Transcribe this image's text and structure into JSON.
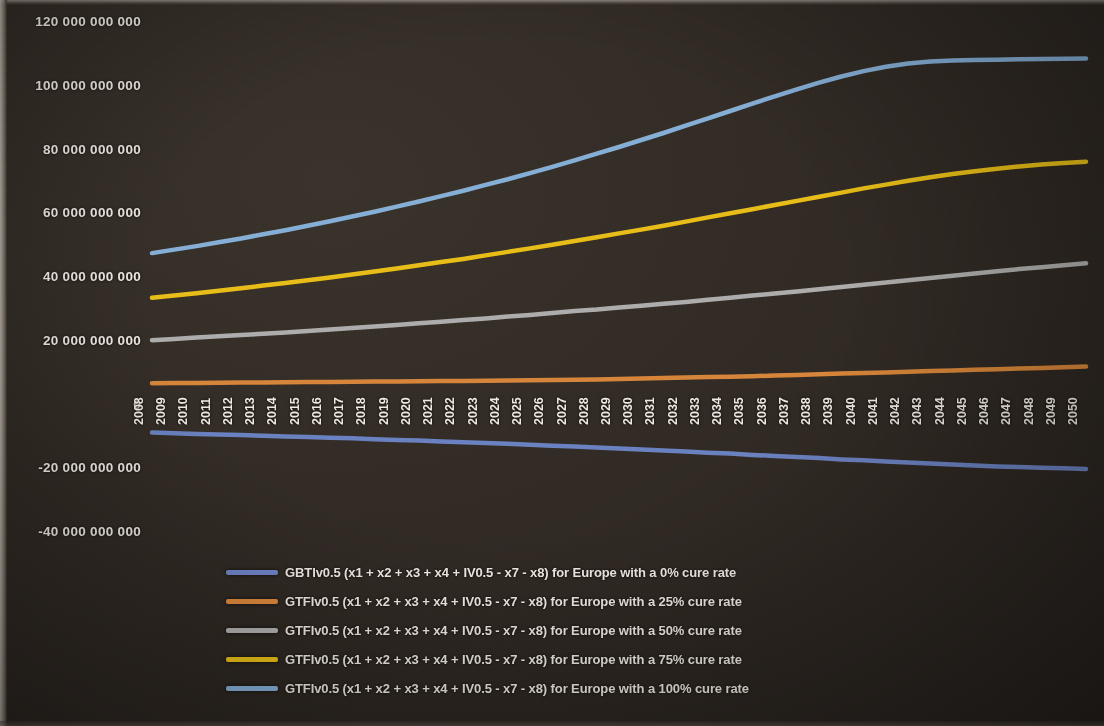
{
  "chart_data": {
    "type": "line",
    "title": "",
    "xlabel": "",
    "ylabel": "",
    "grid": false,
    "legend_position": "bottom",
    "ylim": [
      -40000000000,
      120000000000
    ],
    "ytick_labels": [
      "120 000 000 000",
      "100 000 000 000",
      "80 000 000 000",
      "60 000 000 000",
      "40 000 000 000",
      "20 000 000 000",
      "0",
      "-20 000 000 000",
      "-40 000 000 000"
    ],
    "ytick_values": [
      120000000000,
      100000000000,
      80000000000,
      60000000000,
      40000000000,
      20000000000,
      0,
      -20000000000,
      -40000000000
    ],
    "categories": [
      "2008",
      "2009",
      "2010",
      "2011",
      "2012",
      "2013",
      "2014",
      "2015",
      "2016",
      "2017",
      "2018",
      "2019",
      "2020",
      "2021",
      "2022",
      "2023",
      "2024",
      "2025",
      "2026",
      "2027",
      "2028",
      "2029",
      "2030",
      "2031",
      "2032",
      "2033",
      "2034",
      "2035",
      "2036",
      "2037",
      "2038",
      "2039",
      "2040",
      "2041",
      "2042",
      "2043",
      "2044",
      "2045",
      "2046",
      "2047",
      "2048",
      "2049",
      "2050"
    ],
    "series": [
      {
        "name": "GBTIv0.5 (x1 + x2 + x3 + x4 + IV0.5 - x7 - x8) for Europe with a 0% cure rate",
        "color": "#6f86c9",
        "values": [
          -8500000000,
          -8700000000,
          -8900000000,
          -9100000000,
          -9300000000,
          -9500000000,
          -9700000000,
          -9900000000,
          -10100000000,
          -10300000000,
          -10600000000,
          -10800000000,
          -11000000000,
          -11300000000,
          -11500000000,
          -11800000000,
          -12000000000,
          -12300000000,
          -12600000000,
          -12900000000,
          -13200000000,
          -13500000000,
          -13800000000,
          -14100000000,
          -14400000000,
          -14800000000,
          -15100000000,
          -15500000000,
          -15800000000,
          -16200000000,
          -16500000000,
          -16900000000,
          -17200000000,
          -17600000000,
          -17900000000,
          -18200000000,
          -18500000000,
          -18800000000,
          -19100000000,
          -19300000000,
          -19500000000,
          -19700000000,
          -19900000000
        ]
      },
      {
        "name": "GTFIv0.5 (x1 + x2 + x3 + x4 + IV0.5 - x7 - x8) for Europe with a 25% cure rate",
        "color": "#e08a3c",
        "values": [
          7000000000,
          7050000000,
          7100000000,
          7150000000,
          7200000000,
          7250000000,
          7300000000,
          7350000000,
          7400000000,
          7450000000,
          7500000000,
          7550000000,
          7600000000,
          7650000000,
          7700000000,
          7750000000,
          7800000000,
          7900000000,
          8000000000,
          8100000000,
          8200000000,
          8300000000,
          8450000000,
          8600000000,
          8750000000,
          8900000000,
          9050000000,
          9200000000,
          9400000000,
          9600000000,
          9800000000,
          10000000000,
          10200000000,
          10400000000,
          10600000000,
          10800000000,
          11000000000,
          11200000000,
          11400000000,
          11600000000,
          11800000000,
          12000000000,
          12200000000
        ]
      },
      {
        "name": "GTFIv0.5 (x1 + x2 + x3 + x4 + IV0.5 - x7 - x8) for Europe with a 50% cure rate",
        "color": "#b4b4b4",
        "values": [
          20500000000,
          20900000000,
          21300000000,
          21700000000,
          22100000000,
          22500000000,
          22900000000,
          23400000000,
          23800000000,
          24300000000,
          24800000000,
          25300000000,
          25800000000,
          26300000000,
          26800000000,
          27300000000,
          27900000000,
          28400000000,
          29000000000,
          29600000000,
          30100000000,
          30700000000,
          31300000000,
          31900000000,
          32500000000,
          33200000000,
          33800000000,
          34500000000,
          35100000000,
          35800000000,
          36500000000,
          37200000000,
          37900000000,
          38600000000,
          39300000000,
          40000000000,
          40700000000,
          41400000000,
          42100000000,
          42800000000,
          43400000000,
          44000000000,
          44600000000
        ]
      },
      {
        "name": "GTFIv0.5 (x1 + x2 + x3 + x4 + IV0.5 - x7 - x8) for Europe with a 75% cure rate",
        "color": "#f2c518",
        "values": [
          33800000000,
          34500000000,
          35200000000,
          36000000000,
          36800000000,
          37600000000,
          38400000000,
          39300000000,
          40200000000,
          41100000000,
          42000000000,
          43000000000,
          44000000000,
          45000000000,
          46000000000,
          47100000000,
          48200000000,
          49300000000,
          50400000000,
          51600000000,
          52800000000,
          54000000000,
          55200000000,
          56400000000,
          57700000000,
          59000000000,
          60300000000,
          61600000000,
          62900000000,
          64200000000,
          65500000000,
          66800000000,
          68100000000,
          69300000000,
          70500000000,
          71600000000,
          72600000000,
          73500000000,
          74300000000,
          75000000000,
          75600000000,
          76100000000,
          76500000000
        ]
      },
      {
        "name": "GTFIv0.5 (x1 + x2 + x3 + x4 + IV0.5 - x7 - x8) for Europe with a 100% cure rate",
        "color": "#8ab6e0",
        "values": [
          47800000000,
          48900000000,
          50000000000,
          51200000000,
          52400000000,
          53700000000,
          55000000000,
          56400000000,
          57800000000,
          59300000000,
          60800000000,
          62400000000,
          64000000000,
          65700000000,
          67400000000,
          69200000000,
          71000000000,
          72900000000,
          74900000000,
          76900000000,
          79000000000,
          81100000000,
          83300000000,
          85500000000,
          87800000000,
          90100000000,
          92400000000,
          94700000000,
          97000000000,
          99200000000,
          101300000000,
          103200000000,
          104900000000,
          106300000000,
          107300000000,
          107900000000,
          108200000000,
          108400000000,
          108500000000,
          108600000000,
          108700000000,
          108800000000,
          108900000000
        ]
      }
    ]
  }
}
